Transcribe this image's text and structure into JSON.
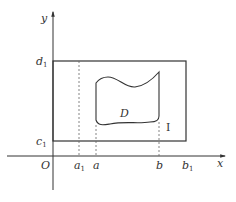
{
  "diagram": {
    "type": "coordinate-region-diagram",
    "colors": {
      "stroke": "#333333",
      "dashed": "#666666",
      "background": "#ffffff"
    },
    "axes": {
      "x_label": "x",
      "y_label": "y",
      "origin_label": "O"
    },
    "x_ticks": [
      {
        "base": "a",
        "sub": "1"
      },
      {
        "base": "a",
        "sub": ""
      },
      {
        "base": "b",
        "sub": ""
      },
      {
        "base": "b",
        "sub": "1"
      }
    ],
    "y_ticks": [
      {
        "base": "d",
        "sub": "1"
      },
      {
        "base": "c",
        "sub": "1"
      }
    ],
    "region_label": "D",
    "rectangle_label": "I"
  }
}
